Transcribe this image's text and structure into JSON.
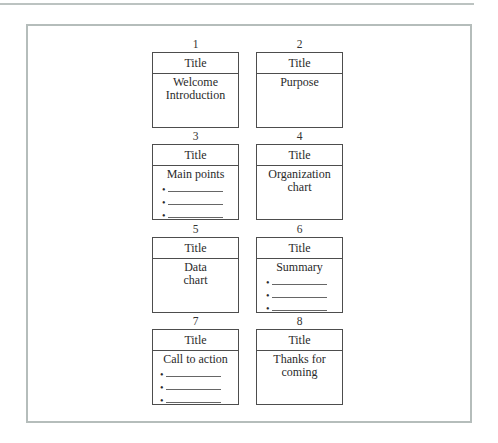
{
  "bullet_glyph": "•",
  "slides": [
    {
      "number": "1",
      "title": "Title",
      "body": [
        "Welcome",
        "Introduction"
      ]
    },
    {
      "number": "2",
      "title": "Title",
      "body": [
        "Purpose"
      ]
    },
    {
      "number": "3",
      "title": "Title",
      "body": [
        "Main points"
      ],
      "bullets": [
        "",
        "",
        ""
      ]
    },
    {
      "number": "4",
      "title": "Title",
      "body": [
        "Organization",
        "chart"
      ]
    },
    {
      "number": "5",
      "title": "Title",
      "body": [
        "Data",
        "chart"
      ]
    },
    {
      "number": "6",
      "title": "Title",
      "body": [
        "Summary"
      ],
      "bullets": [
        "",
        "",
        ""
      ]
    },
    {
      "number": "7",
      "title": "Title",
      "body": [
        "Call to action"
      ],
      "bullets": [
        "",
        "",
        ""
      ]
    },
    {
      "number": "8",
      "title": "Title",
      "body": [
        "Thanks for",
        "coming"
      ]
    }
  ],
  "colors": {
    "frame_border": "#b5bdbb",
    "box_border": "#4d4d4d",
    "text": "#2a2a2a"
  }
}
